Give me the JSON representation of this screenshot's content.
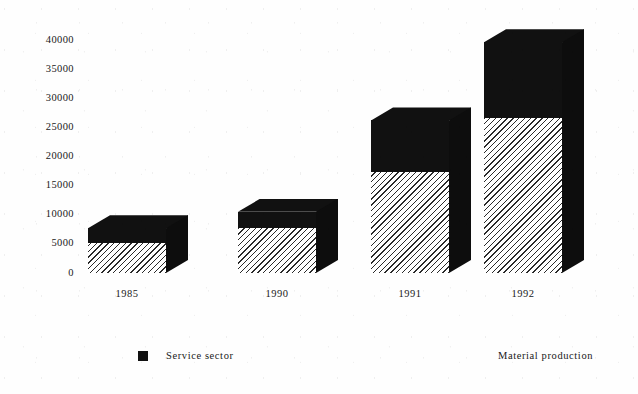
{
  "chart_data": {
    "type": "bar",
    "title": "",
    "subtitle": "",
    "xlabel": "",
    "ylabel": "",
    "stacked": true,
    "three_d": true,
    "grid": false,
    "legend_position": "bottom",
    "categories": [
      "1985",
      "1990",
      "1991",
      "1992"
    ],
    "ylim": [
      0,
      40000
    ],
    "yticks": [
      0,
      5000,
      10000,
      15000,
      20000,
      25000,
      30000,
      35000,
      40000
    ],
    "ytick_labels": [
      "0",
      "5000",
      "10000",
      "15000",
      "20000",
      "25000",
      "30000",
      "35000",
      "40000"
    ],
    "series": [
      {
        "name": "Material production",
        "fill": "diagonal-hatch",
        "values": [
          5100,
          7700,
          17300,
          26600
        ]
      },
      {
        "name": "Service sector",
        "fill": "solid-black",
        "values": [
          2600,
          2800,
          8900,
          13000
        ]
      }
    ],
    "totals": [
      7700,
      10500,
      26200,
      39600
    ],
    "colors": {
      "service_sector": "#111111",
      "material_production": "#ffffff",
      "hatch_line": "#2a2a2a",
      "side_face": "#0d0d0d",
      "background": "#fefefe",
      "text": "#202020"
    }
  },
  "legend": {
    "entries": [
      {
        "label": "Service sector",
        "swatch": "solid-black",
        "show_swatch": true
      },
      {
        "label": "Material production",
        "swatch": "diagonal-hatch",
        "show_swatch": false
      }
    ]
  }
}
